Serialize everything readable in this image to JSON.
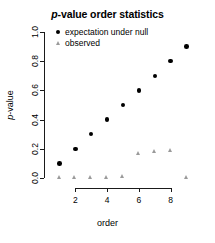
{
  "chart_data": {
    "type": "scatter",
    "title": "p-value order statistics",
    "title_parts": {
      "italic": "p",
      "rest": "-value order statistics"
    },
    "xlabel": "order",
    "ylabel": "p-value",
    "ylabel_parts": {
      "italic": "p",
      "rest": "-value"
    },
    "x": [
      1,
      2,
      3,
      4,
      5,
      6,
      7,
      8,
      9
    ],
    "xlim": [
      0.6,
      9.4
    ],
    "ylim": [
      0.0,
      1.0
    ],
    "grid": false,
    "legend_position": "top-left",
    "xticks": [
      2,
      4,
      6,
      8
    ],
    "xtick_labels": [
      "2",
      "4",
      "6",
      "8"
    ],
    "yticks": [
      0.0,
      0.2,
      0.4,
      0.6,
      0.8,
      1.0
    ],
    "ytick_labels": [
      "0.0",
      "0.2",
      "0.4",
      "0.6",
      "0.8",
      "1.0"
    ],
    "series": [
      {
        "name": "expectation under null",
        "marker": "circle",
        "color": "#000000",
        "values": [
          0.1,
          0.2,
          0.3,
          0.4,
          0.5,
          0.6,
          0.7,
          0.8,
          0.9
        ]
      },
      {
        "name": "observed",
        "marker": "triangle",
        "color": "#9a9a9a",
        "values": [
          0.0,
          0.0,
          0.0,
          0.0,
          0.01,
          0.17,
          0.18,
          0.19,
          0.0
        ]
      }
    ]
  },
  "legend": {
    "items": [
      {
        "label": "expectation under null",
        "marker": "circle"
      },
      {
        "label": "observed",
        "marker": "triangle"
      }
    ]
  }
}
